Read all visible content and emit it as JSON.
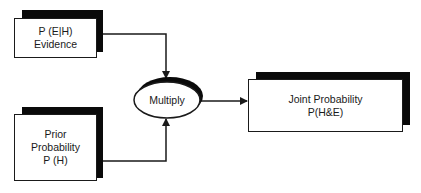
{
  "diagram": {
    "type": "flowchart",
    "nodes": {
      "evidence": {
        "shape": "rectangle-with-shadow",
        "lines": [
          "P (E|H)",
          "Evidence"
        ]
      },
      "prior": {
        "shape": "rectangle-with-shadow",
        "lines": [
          "Prior",
          "Probability",
          "P (H)"
        ]
      },
      "multiply": {
        "shape": "ellipse-with-shadow",
        "label": "Multiply"
      },
      "joint": {
        "shape": "rectangle-with-shadow",
        "lines": [
          "Joint Probability",
          "P(H&E)"
        ]
      }
    },
    "edges": [
      {
        "from": "evidence",
        "to": "multiply"
      },
      {
        "from": "prior",
        "to": "multiply"
      },
      {
        "from": "multiply",
        "to": "joint"
      }
    ],
    "colors": {
      "stroke": "#1a1a1a",
      "shadow": "#0a0a0a",
      "fill": "#ffffff"
    }
  }
}
